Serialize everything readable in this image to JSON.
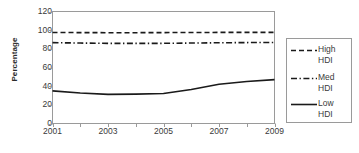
{
  "chart_data": {
    "type": "line",
    "title": "",
    "xlabel": "",
    "ylabel": "Percentage",
    "ylim": [
      0,
      120
    ],
    "xlim": [
      2001,
      2009
    ],
    "grid": false,
    "legend_position": "right-outside",
    "x": [
      2001,
      2002,
      2003,
      2004,
      2005,
      2006,
      2007,
      2008,
      2009
    ],
    "xtick_labels": [
      "2001",
      "2003",
      "2005",
      "2007",
      "2009"
    ],
    "xtick_values": [
      2001,
      2003,
      2005,
      2007,
      2009
    ],
    "ytick_labels": [
      "0",
      "20",
      "40",
      "60",
      "80",
      "100",
      "120"
    ],
    "ytick_values": [
      0,
      20,
      40,
      60,
      80,
      100,
      120
    ],
    "series": [
      {
        "name": "High HDI",
        "legend_line1": "High",
        "legend_line2": "HDI",
        "style": "dashed",
        "color": "#1a1a1a",
        "values": [
          97.5,
          97.4,
          97.3,
          97.3,
          97.4,
          97.5,
          97.6,
          97.6,
          97.6
        ]
      },
      {
        "name": "Med HDI",
        "legend_line1": "Med",
        "legend_line2": "HDI",
        "style": "dash-dot",
        "color": "#1a1a1a",
        "values": [
          86.6,
          86.2,
          85.9,
          85.8,
          85.9,
          86.2,
          86.5,
          86.7,
          86.8
        ]
      },
      {
        "name": "Low HDI",
        "legend_line1": "Low",
        "legend_line2": "HDI",
        "style": "solid",
        "color": "#1a1a1a",
        "values": [
          35.0,
          32.6,
          31.2,
          31.5,
          32.2,
          36.5,
          42.0,
          45.0,
          47.0
        ]
      }
    ]
  },
  "axes": {
    "y_title": "Percentage"
  },
  "colors": {
    "axis": "#9a9a9a",
    "line": "#1a1a1a",
    "text": "#3a3a3a"
  }
}
